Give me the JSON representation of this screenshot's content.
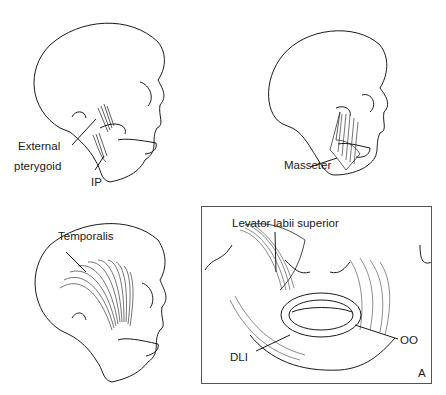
{
  "figure": {
    "panels": [
      {
        "id": "external-pterygoid",
        "position": "top-left",
        "labels": {
          "primary": "External",
          "primary_line2": "pterygoid",
          "secondary": "IP"
        }
      },
      {
        "id": "masseter",
        "position": "top-right",
        "labels": {
          "primary": "Masseter"
        }
      },
      {
        "id": "temporalis",
        "position": "bottom-left",
        "labels": {
          "primary": "Temporalis"
        }
      },
      {
        "id": "perioral",
        "position": "bottom-right",
        "boxed": true,
        "labels": {
          "primary": "Levator labii superior",
          "oo": "OO",
          "dli": "DLI",
          "panel_letter": "A"
        }
      }
    ],
    "colors": {
      "line": "#1a1a1a",
      "background": "#ffffff",
      "frame": "#555555"
    }
  }
}
